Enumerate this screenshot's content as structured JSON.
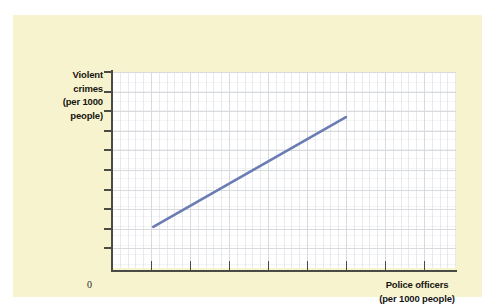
{
  "figure": {
    "panel_background": "#f8f3cf",
    "page_background": "#ffffff",
    "plot_background": "#ffffff"
  },
  "axes": {
    "origin_label": "0",
    "y_label_lines": [
      "Violent",
      "crimes",
      "(per 1000",
      "people)"
    ],
    "x_label_lines": [
      "Police officers",
      "(per 1000 people)"
    ]
  },
  "chart_data": {
    "type": "line",
    "title": "",
    "subtitle": "",
    "xlabel": "Police officers (per 1000 people)",
    "ylabel": "Violent crimes (per 1000 people)",
    "x": [
      1.2,
      6.8
    ],
    "y": [
      2.1,
      7.7
    ],
    "series": [
      {
        "name": "Violent crimes vs police officers",
        "x": [
          1.2,
          6.8
        ],
        "values": [
          2.1,
          7.7
        ],
        "color": "#6b7cb4",
        "line_width": 2.6,
        "relationship": "positive"
      }
    ],
    "xlim": [
      0,
      10
    ],
    "ylim": [
      0,
      10
    ],
    "x_ticks": [
      1,
      2,
      3,
      4,
      5,
      6,
      7,
      8,
      9,
      10
    ],
    "y_ticks": [
      1,
      2,
      3,
      4,
      5,
      6,
      7,
      8,
      9,
      10
    ],
    "x_tick_labels": [],
    "y_tick_labels": [],
    "grid": true,
    "grid_color": "#d8dade",
    "legend": false,
    "legend_position": "none",
    "annotations": []
  },
  "colors": {
    "line": "#6b7cb4",
    "axis": "#4b4b45",
    "grid": "#d8dade",
    "panel": "#f8f3cf",
    "text": "#16160f"
  }
}
